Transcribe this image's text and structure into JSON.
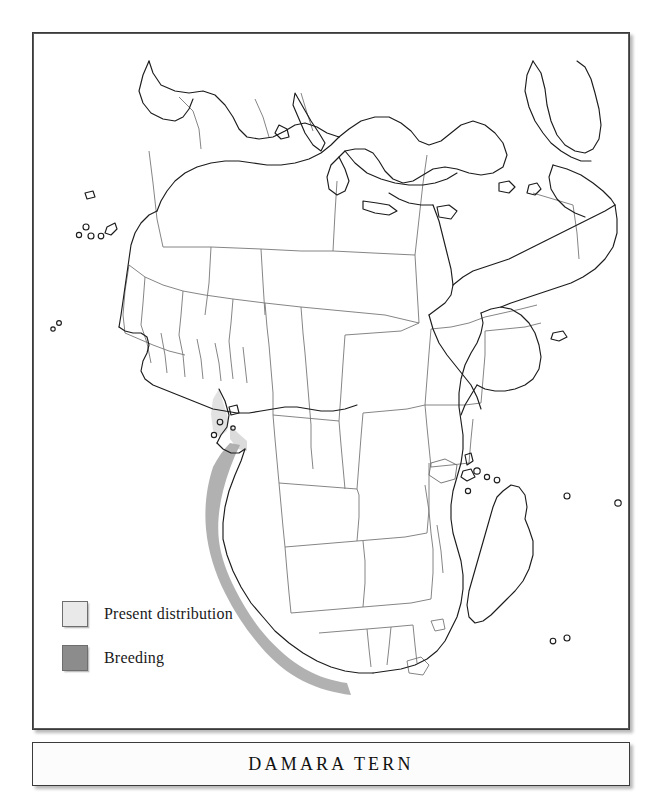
{
  "title": {
    "text": "DAMARA TERN"
  },
  "legend": {
    "items": [
      {
        "label": "Present distribution",
        "color": "#e9e9e9",
        "swatch_name": "present-distribution-swatch"
      },
      {
        "label": "Breeding",
        "color": "#8c8c8c",
        "swatch_name": "breeding-swatch"
      }
    ]
  },
  "map": {
    "region": "Africa",
    "projection_note": "Africa, Mediterranean, Arabian Peninsula and western Indian Ocean",
    "colors": {
      "land_fill": "#ffffff",
      "coastline": "#1e1e1e",
      "country_border": "#6b6b6b",
      "distribution_band": "#bdbdbd",
      "breeding_band": "#8c8c8c",
      "frame": "#3b3b3b",
      "background": "#ffffff"
    },
    "distribution": {
      "present_description": "Narrow coastal band along the Atlantic seaboard from the Gulf of Guinea south through Angola and Namibia to the Cape, South Africa",
      "breeding_description": "Coastal strip of Namibia and adjacent south-western Africa"
    }
  }
}
